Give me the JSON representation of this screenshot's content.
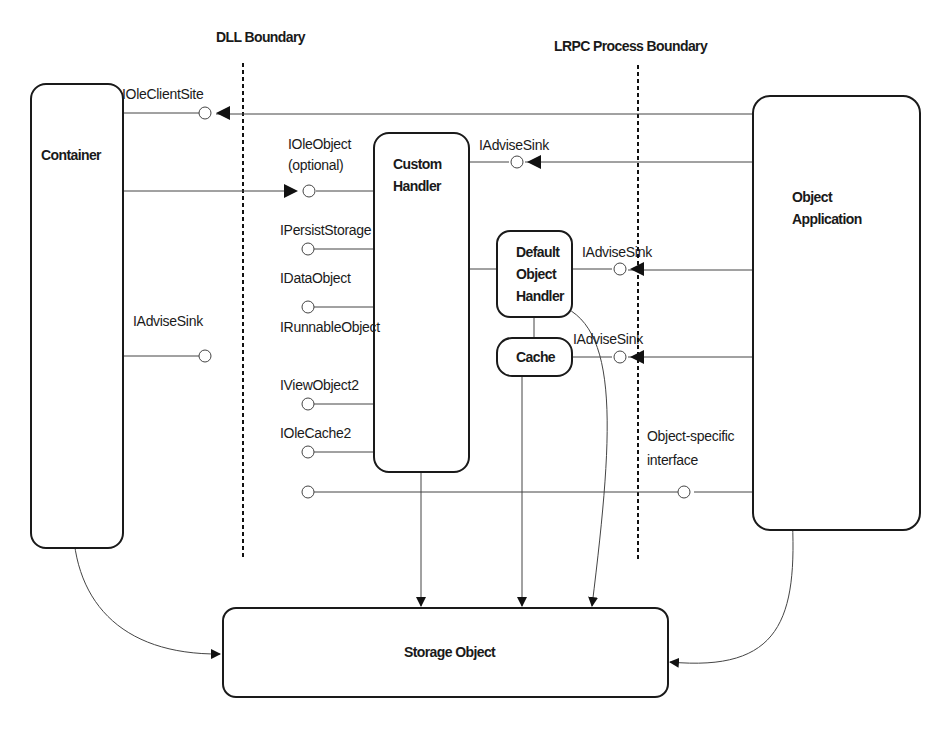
{
  "diagram": {
    "boundaries": {
      "dll": "DLL Boundary",
      "lrpc": "LRPC Process Boundary"
    },
    "components": {
      "container": "Container",
      "custom_handler": [
        "Custom",
        "Handler"
      ],
      "default_handler": [
        "Default",
        "Object",
        "Handler"
      ],
      "cache": "Cache",
      "object_application": [
        "Object",
        "Application"
      ],
      "storage_object": "Storage Object"
    },
    "interfaces": {
      "ole_client_site": "IOleClientSite",
      "ole_object": [
        "IOleObject",
        "(optional)"
      ],
      "advise_sink_custom": "IAdviseSink",
      "persist_storage": "IPersistStorage",
      "data_object": "IDataObject",
      "runnable_object": "IRunnableObject",
      "view_object2": "IViewObject2",
      "ole_cache2": "IOleCache2",
      "advise_sink_container": "IAdviseSink",
      "advise_sink_default": "IAdviseSink",
      "advise_sink_cache": "IAdviseSink",
      "object_specific": [
        "Object-specific",
        "interface"
      ]
    }
  }
}
